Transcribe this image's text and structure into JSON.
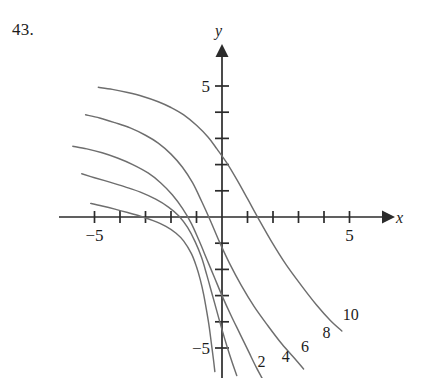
{
  "problem": {
    "number": "43."
  },
  "chart_data": {
    "type": "line",
    "title": "",
    "subtitle": "",
    "xlabel": "x",
    "ylabel": "y",
    "grid": false,
    "legend_position": "inline-right-of-curve-ends",
    "xlim": [
      -6.4,
      6.1
    ],
    "ylim": [
      -6.2,
      6.2
    ],
    "x_ticks": [
      -5,
      -4,
      -3,
      -2,
      -1,
      1,
      2,
      3,
      4,
      5
    ],
    "y_ticks": [
      -5,
      -4,
      -3,
      -2,
      -1,
      1,
      2,
      3,
      4,
      5
    ],
    "x_tick_labels": [
      {
        "value": -5,
        "text": "−5"
      },
      {
        "value": 5,
        "text": "5"
      }
    ],
    "y_tick_labels": [
      {
        "value": 5,
        "text": "5"
      },
      {
        "value": -5,
        "text": "−5"
      }
    ],
    "axis_arrows": [
      "x-positive",
      "y-positive"
    ],
    "series": [
      {
        "name": "2",
        "label": "2",
        "label_position": {
          "x": 1.55,
          "y": -5.72
        },
        "points": [
          [
            -5.15,
            0.52
          ],
          [
            -4.7,
            0.42
          ],
          [
            -4.2,
            0.3
          ],
          [
            -3.7,
            0.17
          ],
          [
            -3.2,
            0.03
          ],
          [
            -2.7,
            -0.14
          ],
          [
            -2.2,
            -0.36
          ],
          [
            -1.8,
            -0.62
          ],
          [
            -1.5,
            -0.92
          ],
          [
            -1.2,
            -1.4
          ],
          [
            -1.0,
            -1.9
          ],
          [
            -0.85,
            -2.4
          ],
          [
            -0.72,
            -2.95
          ],
          [
            -0.6,
            -3.6
          ],
          [
            -0.5,
            -4.2
          ],
          [
            -0.42,
            -4.8
          ],
          [
            -0.34,
            -5.4
          ],
          [
            -0.28,
            -5.9
          ]
        ]
      },
      {
        "name": "4",
        "label": "4",
        "label_position": {
          "x": 2.5,
          "y": -5.55
        },
        "points": [
          [
            -5.5,
            1.65
          ],
          [
            -5.0,
            1.5
          ],
          [
            -4.4,
            1.33
          ],
          [
            -3.8,
            1.15
          ],
          [
            -3.2,
            0.95
          ],
          [
            -2.6,
            0.68
          ],
          [
            -2.1,
            0.38
          ],
          [
            -1.7,
            0.05
          ],
          [
            -1.35,
            -0.4
          ],
          [
            -1.05,
            -0.95
          ],
          [
            -0.8,
            -1.55
          ],
          [
            -0.6,
            -2.2
          ],
          [
            -0.4,
            -2.9
          ],
          [
            -0.2,
            -3.6
          ],
          [
            0.0,
            -4.3
          ],
          [
            0.2,
            -4.95
          ],
          [
            0.4,
            -5.55
          ],
          [
            0.58,
            -6.05
          ]
        ]
      },
      {
        "name": "6",
        "label": "6",
        "label_position": {
          "x": 3.25,
          "y": -5.15
        },
        "points": [
          [
            -5.85,
            2.7
          ],
          [
            -5.3,
            2.6
          ],
          [
            -4.7,
            2.45
          ],
          [
            -4.1,
            2.25
          ],
          [
            -3.5,
            2.0
          ],
          [
            -2.9,
            1.68
          ],
          [
            -2.4,
            1.3
          ],
          [
            -1.95,
            0.85
          ],
          [
            -1.55,
            0.33
          ],
          [
            -1.2,
            -0.25
          ],
          [
            -0.9,
            -0.9
          ],
          [
            -0.6,
            -1.6
          ],
          [
            -0.3,
            -2.3
          ],
          [
            0.0,
            -3.0
          ],
          [
            0.35,
            -3.75
          ],
          [
            0.7,
            -4.45
          ],
          [
            1.05,
            -5.15
          ],
          [
            1.35,
            -5.75
          ],
          [
            1.6,
            -6.2
          ]
        ]
      },
      {
        "name": "8",
        "label": "8",
        "label_position": {
          "x": 4.1,
          "y": -4.6
        },
        "points": [
          [
            -5.35,
            3.9
          ],
          [
            -4.8,
            3.78
          ],
          [
            -4.2,
            3.6
          ],
          [
            -3.6,
            3.4
          ],
          [
            -3.0,
            3.12
          ],
          [
            -2.5,
            2.82
          ],
          [
            -2.0,
            2.4
          ],
          [
            -1.55,
            1.9
          ],
          [
            -1.15,
            1.3
          ],
          [
            -0.8,
            0.6
          ],
          [
            -0.45,
            -0.15
          ],
          [
            -0.1,
            -0.95
          ],
          [
            0.3,
            -1.78
          ],
          [
            0.75,
            -2.6
          ],
          [
            1.25,
            -3.4
          ],
          [
            1.8,
            -4.15
          ],
          [
            2.35,
            -4.85
          ],
          [
            2.85,
            -5.4
          ],
          [
            3.2,
            -5.8
          ]
        ]
      },
      {
        "name": "10",
        "label": "10",
        "label_position": {
          "x": 5.05,
          "y": -3.95
        },
        "points": [
          [
            -4.85,
            4.95
          ],
          [
            -4.3,
            4.87
          ],
          [
            -3.7,
            4.75
          ],
          [
            -3.1,
            4.6
          ],
          [
            -2.5,
            4.4
          ],
          [
            -2.0,
            4.18
          ],
          [
            -1.5,
            3.9
          ],
          [
            -1.0,
            3.5
          ],
          [
            -0.55,
            3.05
          ],
          [
            -0.2,
            2.6
          ],
          [
            0.2,
            2.05
          ],
          [
            0.6,
            1.4
          ],
          [
            1.0,
            0.7
          ],
          [
            1.45,
            -0.1
          ],
          [
            1.95,
            -0.95
          ],
          [
            2.5,
            -1.8
          ],
          [
            3.1,
            -2.6
          ],
          [
            3.7,
            -3.35
          ],
          [
            4.25,
            -3.95
          ],
          [
            4.7,
            -4.35
          ]
        ]
      }
    ]
  }
}
